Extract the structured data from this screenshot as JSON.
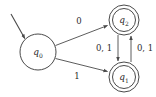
{
  "diagram": {
    "type": "finite-state-automaton",
    "title": "",
    "colors": {
      "stroke": "#4a4a4a",
      "text": "#2b2b2b",
      "background": "#ffffff"
    },
    "states": [
      {
        "id": "q0",
        "label": "q",
        "subscript": "0",
        "accepting": false,
        "start": true,
        "cx": 38,
        "cy": 52,
        "r_outer": 18,
        "r_inner": 14
      },
      {
        "id": "q2",
        "label": "q",
        "subscript": "2",
        "accepting": true,
        "start": false,
        "cx": 124,
        "cy": 20,
        "r_outer": 15,
        "r_inner": 11.5
      },
      {
        "id": "q1",
        "label": "q",
        "subscript": "1",
        "accepting": true,
        "start": false,
        "cx": 124,
        "cy": 77,
        "r_outer": 15,
        "r_inner": 11.5
      }
    ],
    "transitions": [
      {
        "id": "q0-q2",
        "from": "q0",
        "to": "q2",
        "label": "0"
      },
      {
        "id": "q0-q1",
        "from": "q0",
        "to": "q1",
        "label": "1"
      },
      {
        "id": "q2-q1",
        "from": "q2",
        "to": "q1",
        "label": "0, 1"
      },
      {
        "id": "q1-q2",
        "from": "q1",
        "to": "q2",
        "label": "0, 1"
      }
    ],
    "start_marker": {
      "id": "start-arrow",
      "label": ""
    }
  }
}
